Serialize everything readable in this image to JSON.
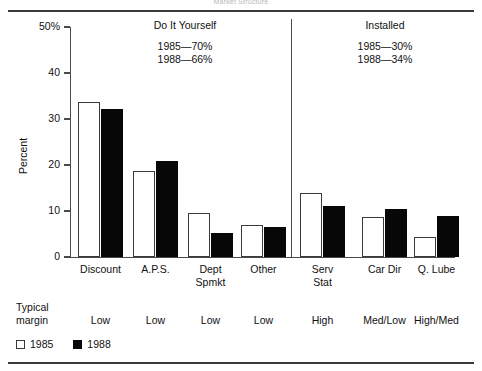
{
  "figure": {
    "faint_title": "Market Structure",
    "y_axis_name": "Percent",
    "y_ticks": [
      "50%",
      "40",
      "30",
      "20",
      "10",
      "0"
    ],
    "sections": [
      {
        "heading": "Do It Yourself",
        "lines": [
          "1985—70%",
          "1988—66%"
        ]
      },
      {
        "heading": "Installed",
        "lines": [
          "1985—30%",
          "1988—34%"
        ]
      }
    ],
    "margin_label": "Typical\nmargin",
    "legend": [
      {
        "swatch": "white-swatch",
        "label": "1985"
      },
      {
        "swatch": "black-swatch",
        "label": "1988"
      }
    ]
  },
  "chart_data": {
    "type": "bar",
    "title": "Market Structure",
    "xlabel": "",
    "ylabel": "Percent",
    "ylim": [
      0,
      50
    ],
    "yticks": [
      0,
      10,
      20,
      30,
      40,
      50
    ],
    "grid": false,
    "legend_position": "bottom-left",
    "categories": [
      "Discount",
      "A.P.S.",
      "Dept\nSpmkt",
      "Other",
      "Serv\nStat",
      "Car Dir",
      "Q. Lube"
    ],
    "series": [
      {
        "name": "1985",
        "color": "#ffffff",
        "values": [
          33.7,
          18.8,
          9.6,
          7.0,
          14.0,
          8.6,
          4.3
        ]
      },
      {
        "name": "1988",
        "color": "#070707",
        "values": [
          32.1,
          20.9,
          5.2,
          6.5,
          11.0,
          10.5,
          9.0
        ]
      }
    ],
    "group_annotations": [
      {
        "group": "Do It Yourself",
        "categories": [
          "Discount",
          "A.P.S.",
          "Dept Spmkt",
          "Other"
        ],
        "1985": "70%",
        "1988": "66%"
      },
      {
        "group": "Installed",
        "categories": [
          "Serv Stat",
          "Car Dir",
          "Q. Lube"
        ],
        "1985": "30%",
        "1988": "34%"
      }
    ],
    "typical_margin": [
      "Low",
      "Low",
      "Low",
      "Low",
      "High",
      "Med/Low",
      "High/Med"
    ]
  }
}
